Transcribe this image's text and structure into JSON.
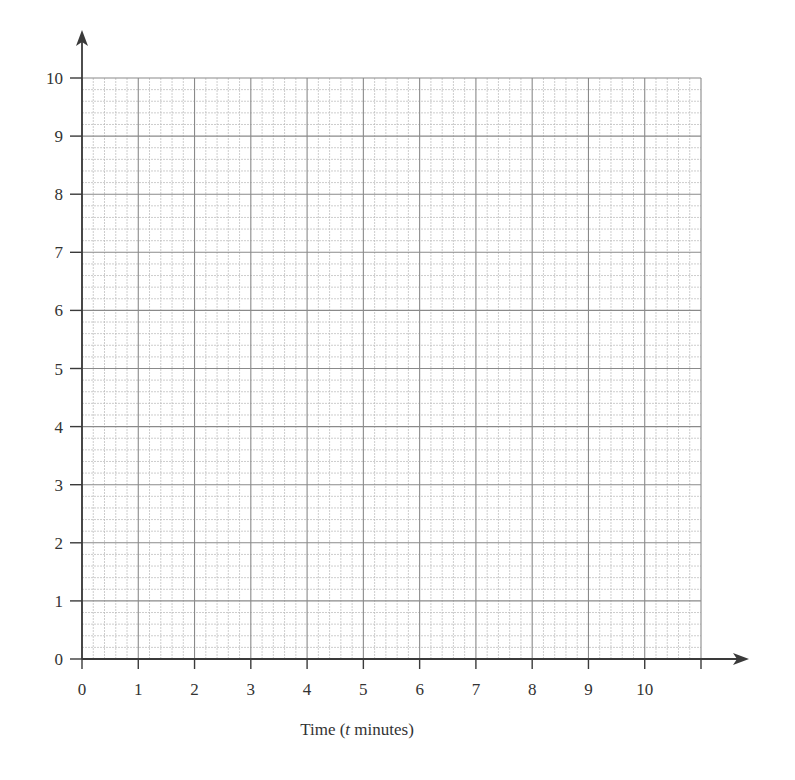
{
  "chart_data": {
    "type": "line",
    "title": "",
    "xlabel": "Time (t minutes)",
    "xlabel_parts": {
      "before": "Time (",
      "italic": "t",
      "after": " minutes)"
    },
    "ylabel": "",
    "xlim": [
      0,
      11
    ],
    "ylim": [
      0,
      10
    ],
    "x_ticks": [
      0,
      1,
      2,
      3,
      4,
      5,
      6,
      7,
      8,
      9,
      10,
      11
    ],
    "x_tick_labels": [
      "0",
      "1",
      "2",
      "3",
      "4",
      "5",
      "6",
      "7",
      "8",
      "9",
      "10",
      ""
    ],
    "y_ticks": [
      0,
      1,
      2,
      3,
      4,
      5,
      6,
      7,
      8,
      9,
      10
    ],
    "y_tick_labels": [
      "0",
      "1",
      "2",
      "3",
      "4",
      "5",
      "6",
      "7",
      "8",
      "9",
      "10"
    ],
    "minor_subdivisions": 5,
    "grid": true,
    "series": [],
    "legend": null
  },
  "colors": {
    "axis": "#3a3a3a",
    "major_grid": "#8a8a8a",
    "minor_grid": "#b8b8b8",
    "text": "#333333"
  }
}
